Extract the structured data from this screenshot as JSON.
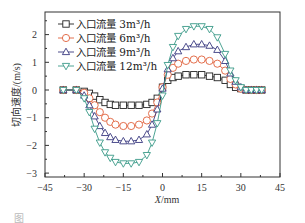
{
  "chart_data": {
    "type": "line",
    "title": "",
    "xlabel": "X/mm",
    "ylabel": "切向速度/(m/s)",
    "xlim": [
      -45,
      45
    ],
    "ylim": [
      -3.2,
      2.8
    ],
    "xticks": [
      -45,
      -30,
      -15,
      0,
      15,
      30,
      45
    ],
    "yticks": [
      -3,
      -2,
      -1,
      0,
      1,
      2
    ],
    "grid": false,
    "legend_position": "upper-left",
    "x": [
      -38,
      -33,
      -30,
      -28,
      -26,
      -24,
      -22,
      -20,
      -18,
      -15,
      -12,
      -9,
      -6,
      -4,
      -2,
      0,
      2,
      4,
      6,
      9,
      12,
      15,
      18,
      21,
      24,
      26,
      28,
      30,
      32,
      34,
      36,
      38
    ],
    "series": [
      {
        "name": "入口流量 3m³/h",
        "color": "#222222",
        "marker": "square",
        "values": [
          0.0,
          0.0,
          -0.05,
          -0.12,
          -0.22,
          -0.35,
          -0.45,
          -0.52,
          -0.55,
          -0.55,
          -0.55,
          -0.55,
          -0.52,
          -0.45,
          -0.3,
          0.1,
          0.35,
          0.45,
          0.5,
          0.55,
          0.55,
          0.55,
          0.5,
          0.45,
          0.35,
          0.2,
          0.1,
          0.05,
          0.0,
          0.0,
          0.0,
          0.0
        ]
      },
      {
        "name": "入口流量 6m³/h",
        "color": "#e0603a",
        "marker": "circle",
        "values": [
          0.0,
          0.0,
          -0.1,
          -0.3,
          -0.55,
          -0.8,
          -1.0,
          -1.15,
          -1.25,
          -1.3,
          -1.3,
          -1.25,
          -1.1,
          -0.85,
          -0.45,
          0.1,
          0.55,
          0.8,
          0.95,
          1.05,
          1.1,
          1.1,
          1.05,
          0.95,
          0.7,
          0.4,
          0.2,
          0.05,
          0.0,
          0.0,
          0.0,
          0.0
        ]
      },
      {
        "name": "入口流量 9m³/h",
        "color": "#3a3a80",
        "marker": "triangle-up",
        "values": [
          0.0,
          0.0,
          -0.2,
          -0.55,
          -0.95,
          -1.3,
          -1.55,
          -1.7,
          -1.8,
          -1.85,
          -1.85,
          -1.8,
          -1.6,
          -1.25,
          -0.7,
          0.05,
          0.75,
          1.15,
          1.4,
          1.55,
          1.65,
          1.65,
          1.6,
          1.45,
          1.05,
          0.6,
          0.3,
          0.1,
          0.0,
          0.0,
          0.0,
          0.0
        ]
      },
      {
        "name": "入口流量 12m³/h",
        "color": "#3a9a88",
        "marker": "triangle-down",
        "values": [
          0.0,
          0.0,
          -0.3,
          -0.8,
          -1.4,
          -1.9,
          -2.25,
          -2.45,
          -2.6,
          -2.65,
          -2.65,
          -2.6,
          -2.35,
          -1.9,
          -1.2,
          -0.2,
          0.9,
          1.55,
          1.95,
          2.2,
          2.3,
          2.3,
          2.2,
          1.9,
          1.3,
          0.7,
          0.35,
          0.1,
          0.0,
          0.0,
          0.0,
          0.0
        ]
      }
    ]
  },
  "labels": {
    "xlabel_prefix": "X",
    "xlabel_suffix": "/mm",
    "ylabel": "切向速度/(m/s)",
    "caption": "图"
  }
}
